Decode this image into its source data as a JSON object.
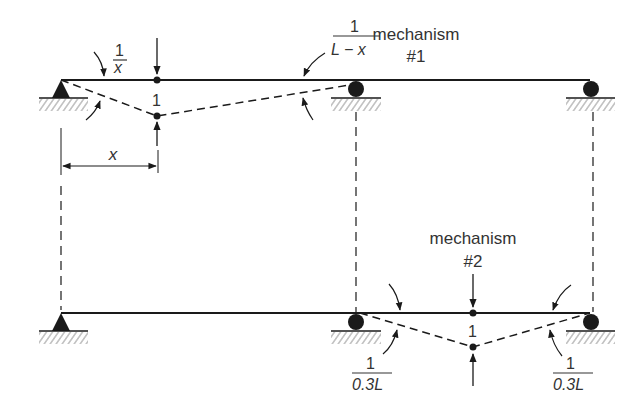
{
  "diagram": {
    "type": "beam collapse mechanisms",
    "colors": {
      "ink": "#1a1a1a",
      "text": "#333333",
      "hatch": "#888888",
      "background": "#ffffff"
    },
    "mechanism1": {
      "title": "mechanism",
      "number": "#1",
      "rotation_left": {
        "num": "1",
        "den": "x"
      },
      "rotation_right": {
        "num": "1",
        "den": "L − x"
      },
      "deflection": "1",
      "dimension": "x"
    },
    "mechanism2": {
      "title": "mechanism",
      "number": "#2",
      "rotation_left": {
        "num": "1",
        "den": "0.3L"
      },
      "rotation_right": {
        "num": "1",
        "den": "0.3L"
      },
      "deflection": "1"
    },
    "supports": [
      "pin",
      "roller",
      "roller"
    ]
  }
}
